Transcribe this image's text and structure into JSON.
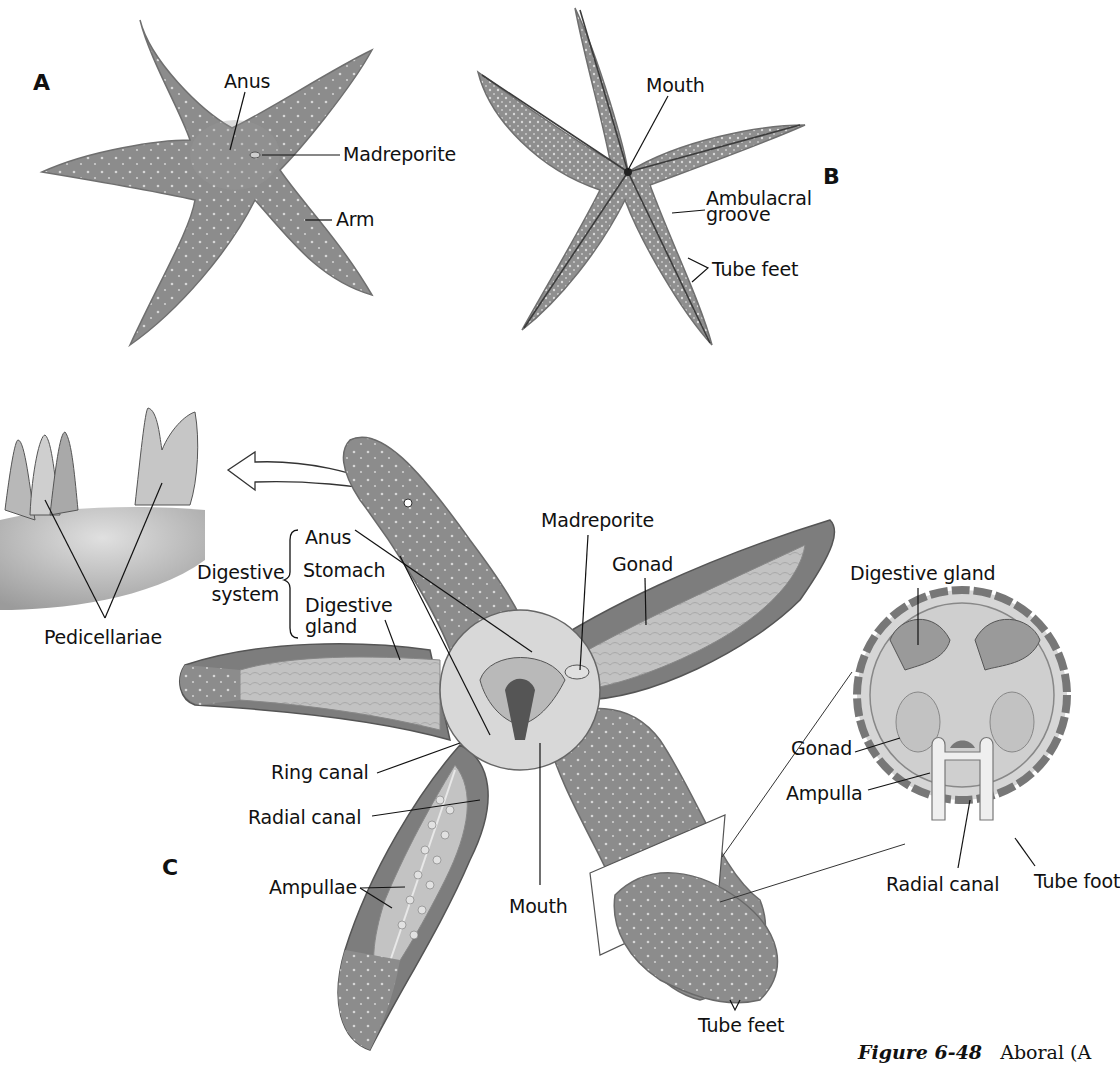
{
  "figure": {
    "caption_label": "Figure 6-48",
    "caption_text": "Aboral (A"
  },
  "panels": {
    "A": {
      "letter": "A",
      "view": "aboral",
      "labels": {
        "anus": "Anus",
        "madreporite": "Madreporite",
        "arm": "Arm"
      }
    },
    "B": {
      "letter": "B",
      "view": "oral",
      "labels": {
        "mouth": "Mouth",
        "ambulacral_1": "Ambulacral",
        "ambulacral_2": "groove",
        "tube_feet": "Tube feet"
      }
    },
    "C": {
      "letter": "C",
      "view": "internal anatomy",
      "labels": {
        "pedicellariae": "Pedicellariae",
        "digestive_system_1": "Digestive",
        "digestive_system_2": "system",
        "anus": "Anus",
        "stomach": "Stomach",
        "digestive_gland_1": "Digestive",
        "digestive_gland_2": "gland",
        "madreporite": "Madreporite",
        "gonad": "Gonad",
        "ring_canal": "Ring canal",
        "radial_canal": "Radial canal",
        "ampullae": "Ampullae",
        "mouth": "Mouth",
        "tube_feet": "Tube feet"
      }
    },
    "cross_section": {
      "labels": {
        "digestive_gland": "Digestive gland",
        "gonad": "Gonad",
        "ampulla": "Ampulla",
        "radial_canal": "Radial canal",
        "tube_foot": "Tube foot"
      }
    }
  },
  "colors": {
    "body": "#8a8a8a",
    "body_dark": "#6f6f6f",
    "body_light": "#a9a9a9",
    "organ": "#c9c9c9",
    "line": "#111111"
  }
}
